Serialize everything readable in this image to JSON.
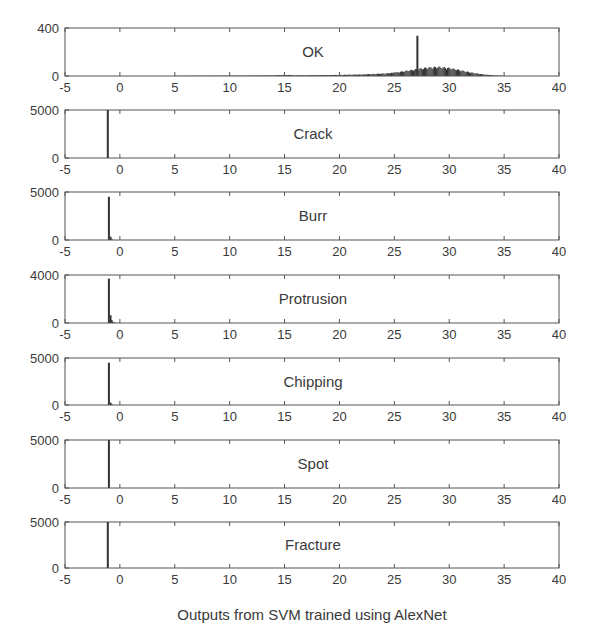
{
  "chart_data": {
    "type": "bar",
    "subtype": "histogram-stack",
    "xlabel": "Outputs from SVM trained using AlexNet",
    "xlim": [
      -5,
      40
    ],
    "xticks": [
      -5,
      0,
      5,
      10,
      15,
      20,
      25,
      30,
      35,
      40
    ],
    "grid": false,
    "legend": null,
    "panels": [
      {
        "title": "OK",
        "ylim": [
          0,
          400
        ],
        "yticks": [
          0,
          400
        ],
        "spike": {
          "x": 27.1,
          "y": 335
        },
        "distribution": {
          "description": "broad low-count histogram from ~5 to ~35, rising from near 0 at x<=20 to peak ~70-85 around x=27-29, tapering to 0 near x=35",
          "x": [
            5,
            10,
            12,
            14,
            15,
            16,
            18,
            20,
            21,
            22,
            23,
            24,
            25,
            26,
            27,
            28,
            29,
            30,
            31,
            32,
            33,
            34,
            35
          ],
          "y": [
            2,
            3,
            4,
            6,
            10,
            6,
            8,
            10,
            12,
            14,
            18,
            22,
            30,
            45,
            60,
            75,
            80,
            70,
            50,
            30,
            15,
            6,
            2
          ]
        }
      },
      {
        "title": "Crack",
        "ylim": [
          0,
          5000
        ],
        "yticks": [
          0,
          5000
        ],
        "spike": {
          "x": -1.1,
          "y": 5000
        },
        "distribution": null
      },
      {
        "title": "Burr",
        "ylim": [
          0,
          5000
        ],
        "yticks": [
          0,
          5000
        ],
        "spike": {
          "x": -1.0,
          "y": 4500
        },
        "distribution": {
          "x": [
            -0.9,
            -0.8
          ],
          "y": [
            350,
            120
          ]
        }
      },
      {
        "title": "Protrusion",
        "ylim": [
          0,
          4000
        ],
        "yticks": [
          0,
          4000
        ],
        "spike": {
          "x": -1.0,
          "y": 3700
        },
        "distribution": {
          "x": [
            -0.9,
            -0.8,
            -0.7,
            -0.5
          ],
          "y": [
            650,
            250,
            100,
            50
          ]
        }
      },
      {
        "title": "Chipping",
        "ylim": [
          0,
          5000
        ],
        "yticks": [
          0,
          5000
        ],
        "spike": {
          "x": -1.0,
          "y": 4500
        },
        "distribution": {
          "x": [
            -0.9,
            -0.8
          ],
          "y": [
            250,
            80
          ]
        }
      },
      {
        "title": "Spot",
        "ylim": [
          0,
          5000
        ],
        "yticks": [
          0,
          5000
        ],
        "spike": {
          "x": -1.0,
          "y": 5000
        },
        "distribution": null
      },
      {
        "title": "Fracture",
        "ylim": [
          0,
          5000
        ],
        "yticks": [
          0,
          5000
        ],
        "spike": {
          "x": -1.1,
          "y": 5800
        },
        "distribution": null
      }
    ]
  },
  "layout": {
    "plot_left": 65,
    "plot_right": 559,
    "panels_px": [
      {
        "top": 28,
        "bottom": 76
      },
      {
        "top": 110,
        "bottom": 158
      },
      {
        "top": 192,
        "bottom": 240
      },
      {
        "top": 275,
        "bottom": 323
      },
      {
        "top": 358,
        "bottom": 405
      },
      {
        "top": 440,
        "bottom": 488
      },
      {
        "top": 522,
        "bottom": 568
      }
    ],
    "colors": {
      "axis": "#555555",
      "bar": "#333333",
      "text": "#3a3a3a"
    }
  }
}
